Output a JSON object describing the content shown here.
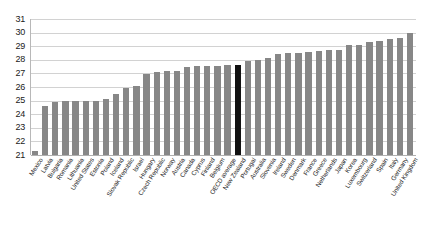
{
  "chart_data": {
    "type": "bar",
    "title": "",
    "subtitle": "",
    "xlabel": "",
    "ylabel": "",
    "ylim": [
      21,
      31
    ],
    "ytick_step": 1,
    "yticks": [
      "21",
      "22",
      "23",
      "24",
      "25",
      "26",
      "27",
      "28",
      "29",
      "30",
      "31"
    ],
    "grid": true,
    "legend": "none",
    "bar_color": "#878787",
    "highlight_color": "#111111",
    "highlight_category": "New Zealand",
    "categories": [
      "Mexico",
      "Latvia",
      "Bulgaria",
      "Romania",
      "Lithuania",
      "United States",
      "Estonia",
      "Poland",
      "Iceland",
      "Slovak Republic",
      "Israel",
      "Hungary",
      "Czech Republic",
      "Norway",
      "Austria",
      "Canada",
      "Cyprus",
      "Finland",
      "Belgium",
      "OECD average",
      "New Zealand",
      "Portugal",
      "Australia",
      "Slovenia",
      "Ireland",
      "Sweden",
      "Denmark",
      "France",
      "Greece",
      "Netherlands",
      "Japan",
      "Korea",
      "Luxembourg",
      "Switzerland",
      "Spain",
      "Italy",
      "Germany",
      "United Kingdom"
    ],
    "values": [
      21.3,
      24.6,
      24.9,
      25.0,
      25.0,
      25.0,
      25.0,
      25.1,
      25.5,
      25.9,
      26.05,
      26.95,
      27.1,
      27.2,
      27.2,
      27.5,
      27.55,
      27.55,
      27.55,
      27.6,
      27.6,
      27.9,
      28.0,
      28.1,
      28.4,
      28.5,
      28.5,
      28.6,
      28.65,
      28.7,
      28.75,
      29.1,
      29.1,
      29.3,
      29.4,
      29.5,
      29.6,
      29.95
    ]
  }
}
